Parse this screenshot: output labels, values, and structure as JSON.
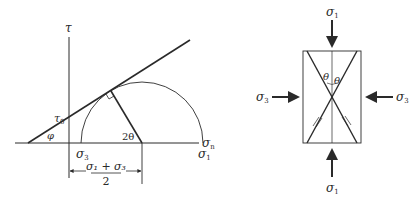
{
  "left_diagram": {
    "title": "Mohr circle with failure envelope",
    "axis_y_label": "τ",
    "axis_x_label": "σ",
    "axis_x_sub": "n",
    "intercept_label": "τ",
    "intercept_sub": "0",
    "friction_angle_label": "φ",
    "sigma3_label": "σ",
    "sigma3_sub": "3",
    "sigma1_label": "σ",
    "sigma1_sub": "1",
    "angle_label": "2θ",
    "center_fraction": {
      "numerator": "σ₁ + σ₃",
      "denominator": "2"
    }
  },
  "right_diagram": {
    "title": "Specimen under principal stresses",
    "top_load_label": "σ",
    "top_load_sub": "1",
    "bottom_load_label": "σ",
    "bottom_load_sub": "1",
    "left_load_label": "σ",
    "left_load_sub": "3",
    "right_load_label": "σ",
    "right_load_sub": "3",
    "theta_left": "θ",
    "theta_right": "θ"
  }
}
